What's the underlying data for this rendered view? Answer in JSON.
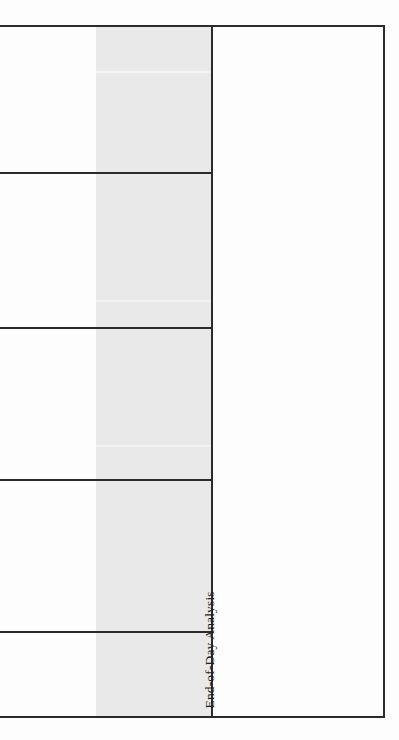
{
  "document": {
    "kind": "scanned-table-fragment",
    "background_color": "#ffffff",
    "rule_color": "#2b2b2b",
    "shaded_column_color": "#e9e9e9"
  },
  "table": {
    "label_column": {
      "text": "End-of-Day Analysis",
      "orientation": "rotated-90-ccw"
    },
    "shaded_column": {
      "present": true,
      "cells": [
        "",
        "",
        "",
        "",
        ""
      ]
    },
    "left_column": {
      "cells": [
        "",
        "",
        "",
        "",
        ""
      ]
    },
    "rows": [
      {
        "index": 1,
        "left_value": "",
        "shaded_value": ""
      },
      {
        "index": 2,
        "left_value": "",
        "shaded_value": ""
      },
      {
        "index": 3,
        "left_value": "",
        "shaded_value": ""
      },
      {
        "index": 4,
        "left_value": "",
        "shaded_value": ""
      },
      {
        "index": 5,
        "left_value": "",
        "shaded_value": ""
      }
    ]
  }
}
